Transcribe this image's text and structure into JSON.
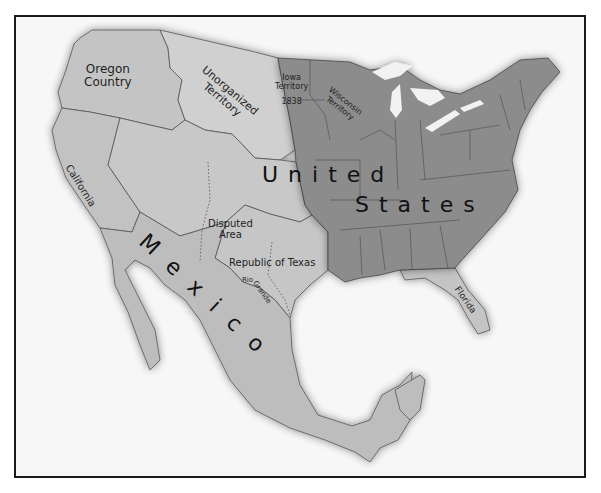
{
  "map": {
    "countries": {
      "us": "United States",
      "us_line1": "United",
      "us_line2": "States",
      "mexico": "Mexico"
    },
    "regions": {
      "oregon_line1": "Oregon",
      "oregon_line2": "Country",
      "unorganized_line1": "Unorganized",
      "unorganized_line2": "Territory",
      "iowa_line1": "Iowa",
      "iowa_line2": "Territory",
      "iowa_year": "1838",
      "wisconsin_line1": "Wisconsin",
      "wisconsin_line2": "Territory",
      "california": "California",
      "disputed_line1": "Disputed",
      "disputed_line2": "Area",
      "texas": "Republic of Texas",
      "rio_grande_1": "Rio",
      "rio_grande_2": "Grande",
      "florida": "Florida"
    },
    "colors": {
      "background": "#f7f7f7",
      "frame": "#1a1a1a",
      "us_states": "#8c8c8c",
      "territories": "#c8c8c8",
      "mexico": "#bdbdbd",
      "water": "#f2f2f2",
      "border_line": "#555555"
    }
  }
}
